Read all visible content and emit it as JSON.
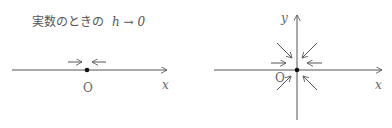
{
  "left_panel": {
    "caption_text": "実数のときの",
    "caption_math": "h → 0",
    "origin_label": "O",
    "x_label": "x"
  },
  "right_panel": {
    "origin_label": "O",
    "x_label": "x",
    "y_label": "y"
  },
  "colors": {
    "line": "#555555",
    "point": "#111111",
    "text": "#666666"
  }
}
